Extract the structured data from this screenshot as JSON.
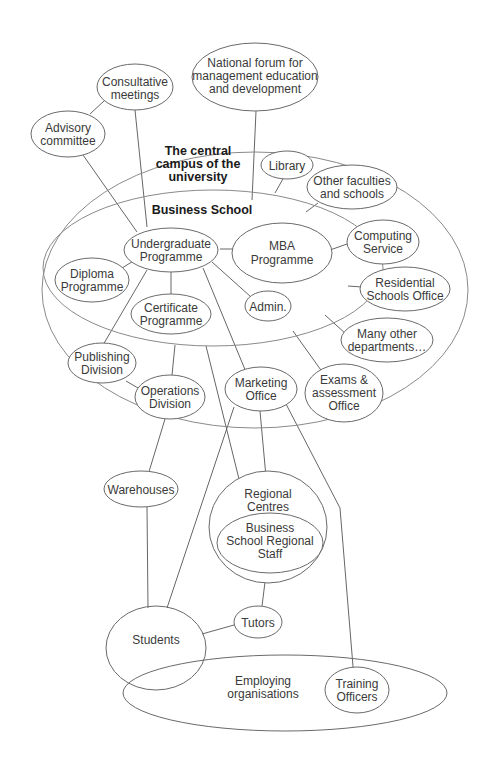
{
  "diagram": {
    "regions": {
      "campus": {
        "label_lines": [
          "The central",
          "campus of the",
          "university"
        ]
      },
      "business_school": {
        "label": "Business School"
      },
      "employing_organisations": {
        "label_lines": [
          "Employing",
          "organisations"
        ]
      }
    },
    "nodes": {
      "national_forum": {
        "lines": [
          "National forum for",
          "management education",
          "and development"
        ]
      },
      "consultative_meetings": {
        "lines": [
          "Consultative",
          "meetings"
        ]
      },
      "advisory_committee": {
        "lines": [
          "Advisory",
          "committee"
        ]
      },
      "library": {
        "lines": [
          "Library"
        ]
      },
      "other_faculties": {
        "lines": [
          "Other faculties",
          "and schools"
        ]
      },
      "undergraduate_programme": {
        "lines": [
          "Undergraduate",
          "Programme"
        ]
      },
      "mba_programme": {
        "lines": [
          "MBA",
          "Programme"
        ]
      },
      "diploma_programme": {
        "lines": [
          "Diploma",
          "Programme"
        ]
      },
      "certificate_programme": {
        "lines": [
          "Certificate",
          "Programme"
        ]
      },
      "admin": {
        "lines": [
          "Admin."
        ]
      },
      "computing_service": {
        "lines": [
          "Computing",
          "Service"
        ]
      },
      "residential_schools_office": {
        "lines": [
          "Residential",
          "Schools Office"
        ]
      },
      "many_other_departments": {
        "lines": [
          "Many other",
          "departments…"
        ]
      },
      "publishing_division": {
        "lines": [
          "Publishing",
          "Division"
        ]
      },
      "operations_division": {
        "lines": [
          "Operations",
          "Division"
        ]
      },
      "marketing_office": {
        "lines": [
          "Marketing",
          "Office"
        ]
      },
      "exams_assessment_office": {
        "lines": [
          "Exams &",
          "assessment",
          "Office"
        ]
      },
      "warehouses": {
        "lines": [
          "Warehouses"
        ]
      },
      "regional_centres": {
        "lines": [
          "Regional",
          "Centres"
        ]
      },
      "business_school_regional_staff": {
        "lines": [
          "Business",
          "School Regional",
          "Staff"
        ]
      },
      "students": {
        "lines": [
          "Students"
        ]
      },
      "tutors": {
        "lines": [
          "Tutors"
        ]
      },
      "training_officers": {
        "lines": [
          "Training",
          "Officers"
        ]
      }
    }
  }
}
